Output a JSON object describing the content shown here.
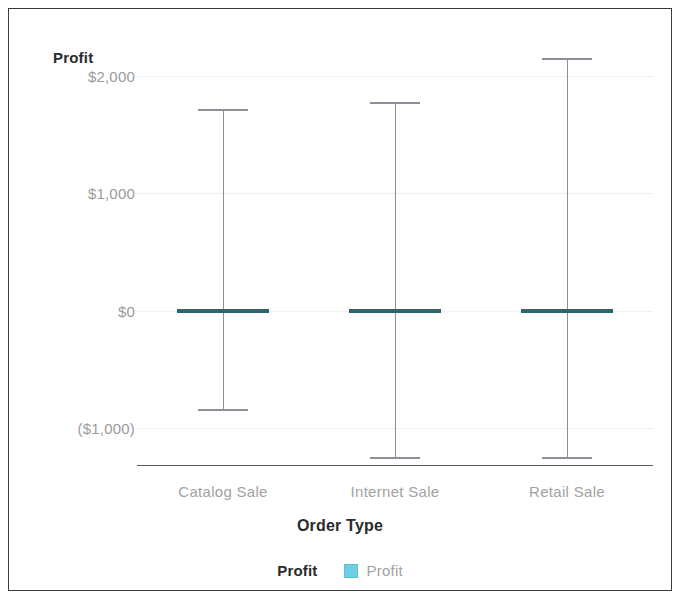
{
  "chart_data": {
    "type": "bar",
    "subtype": "error-bar-range",
    "title": "",
    "xlabel": "Order Type",
    "ylabel": "Profit",
    "categories": [
      "Catalog Sale",
      "Internet Sale",
      "Retail Sale"
    ],
    "y_tick_labels": [
      "$2,000",
      "$1,000",
      "$0",
      "($1,000)"
    ],
    "y_tick_values": [
      2000,
      1000,
      0,
      -1000
    ],
    "ylim": [
      -1320,
      2320
    ],
    "grid": true,
    "grid_axis": "y",
    "legend_position": "bottom",
    "legend_title": "Profit",
    "legend_entries": [
      {
        "name": "Profit",
        "color": "#6ecfe2"
      }
    ],
    "series": [
      {
        "name": "Profit",
        "marker_color": "#2e6670",
        "whisker_color": "#8e8e96",
        "values": [
          0,
          0,
          0
        ],
        "upper": [
          1720,
          1785,
          2155
        ],
        "lower": [
          -845,
          -1255,
          -1255
        ]
      }
    ],
    "points": [
      {
        "category": "Catalog Sale",
        "value": 0,
        "upper": 1720,
        "lower": -845
      },
      {
        "category": "Internet Sale",
        "value": 0,
        "upper": 1785,
        "lower": -1255
      },
      {
        "category": "Retail Sale",
        "value": 0,
        "upper": 2155,
        "lower": -1255
      }
    ]
  },
  "axis": {
    "y_title": "Profit",
    "x_title": "Order Type"
  },
  "legend": {
    "title": "Profit",
    "items": [
      {
        "label": "Profit",
        "color": "#6ecfe2"
      }
    ]
  },
  "colors": {
    "marker": "#2e6670",
    "whisker": "#8e8e96",
    "legend_swatch": "#6ecfe2",
    "gridline": "#e2e2e2",
    "axis_line": "#5b5b5b",
    "tick_text": "#a2a2a2",
    "title_text": "#2b2b2b",
    "frame": "#3b3b3b",
    "background": "#ffffff"
  }
}
